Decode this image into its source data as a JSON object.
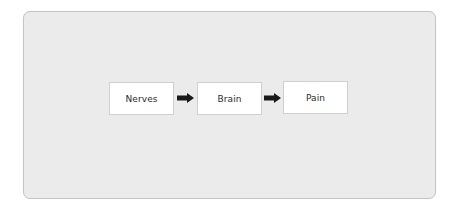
{
  "diagram": {
    "type": "flowchart",
    "direction": "left-to-right",
    "nodes": [
      {
        "id": "nerves",
        "label": "Nerves"
      },
      {
        "id": "brain",
        "label": "Brain"
      },
      {
        "id": "pain",
        "label": "Pain"
      }
    ],
    "edges": [
      {
        "from": "nerves",
        "to": "brain"
      },
      {
        "from": "brain",
        "to": "pain"
      }
    ],
    "colors": {
      "panel_background": "#ebebeb",
      "panel_border": "#c4c4c4",
      "node_background": "#ffffff",
      "node_border": "#cfcfcf",
      "arrow": "#1a1a1a",
      "text": "#2a2a2a"
    }
  }
}
